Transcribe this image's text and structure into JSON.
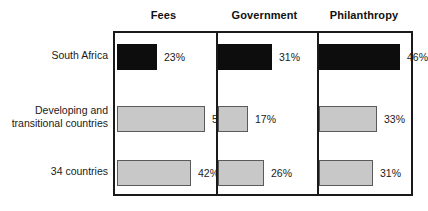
{
  "chart_data": {
    "type": "bar",
    "title": "",
    "xlabel": "",
    "ylabel": "",
    "orientation": "horizontal",
    "grid": false,
    "legend": "none",
    "axis_range_percent": [
      0,
      50
    ],
    "value_suffix": "%",
    "panel_headers": [
      "Fees",
      "Government",
      "Philanthropy"
    ],
    "categories": [
      "South Africa",
      "Developing and\ntransitional countries",
      "34 countries"
    ],
    "series": [
      {
        "name": "Fees",
        "values": [
          23,
          50,
          42
        ]
      },
      {
        "name": "Government",
        "values": [
          31,
          17,
          26
        ]
      },
      {
        "name": "Philanthropy",
        "values": [
          46,
          33,
          31
        ]
      }
    ],
    "value_labels": [
      [
        "23%",
        "50%",
        "42%"
      ],
      [
        "31%",
        "17%",
        "26%"
      ],
      [
        "46%",
        "33%",
        "31%"
      ]
    ],
    "row_styles": [
      "dark",
      "light",
      "light"
    ],
    "colors": {
      "dark_bar": "#0d0d0d",
      "light_bar": "#c8c8c8",
      "bar_outline": "#5a5a5a",
      "frame": "#1a1a1a",
      "background": "#ffffff",
      "text": "#1a1a1a"
    }
  }
}
